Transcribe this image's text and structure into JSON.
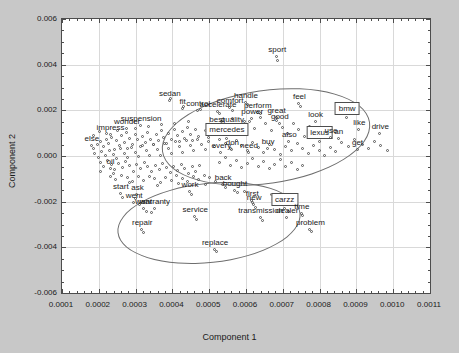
{
  "chart_data": {
    "type": "scatter",
    "title": "",
    "xlabel": "Component 1",
    "ylabel": "Component 2",
    "xlim": [
      0.0001,
      0.0011
    ],
    "ylim": [
      -0.006,
      0.006
    ],
    "xticks": [
      "0.0001",
      "0.0002",
      "0.0003",
      "0.0004",
      "0.0005",
      "0.0006",
      "0.0007",
      "0.0008",
      "0.0009",
      "0.0010",
      "0.0011"
    ],
    "yticks": [
      "0.006",
      "0.004",
      "0.002",
      "0.000",
      "-0.002",
      "-0.004",
      "-0.006"
    ],
    "grid": true,
    "legend": "none",
    "marker": "open-circle",
    "annotations": {
      "ellipses": [
        {
          "name": "upper-right-cluster-ellipse",
          "cx": 0.000655,
          "cy": 0.00085,
          "rx": 0.000285,
          "ry": 0.00205,
          "rotation": -8
        },
        {
          "name": "lower-cluster-ellipse",
          "cx": 0.0005,
          "cy": -0.00295,
          "rx": 0.00025,
          "ry": 0.00175,
          "rotation": -6
        }
      ]
    },
    "labeled_points": [
      {
        "label": "sport",
        "x": 0.000685,
        "y": 0.00435,
        "boxed": false
      },
      {
        "label": "sedan",
        "x": 0.000393,
        "y": 0.00242,
        "boxed": false
      },
      {
        "label": "fit",
        "x": 0.000428,
        "y": 0.00207,
        "boxed": false
      },
      {
        "label": "control",
        "x": 0.00047,
        "y": 0.00196,
        "boxed": false
      },
      {
        "label": "handle",
        "x": 0.0006,
        "y": 0.00232,
        "boxed": false
      },
      {
        "label": "comfort",
        "x": 0.000557,
        "y": 0.00212,
        "boxed": false
      },
      {
        "label": "accelerate",
        "x": 0.000524,
        "y": 0.00194,
        "boxed": false
      },
      {
        "label": "feel",
        "x": 0.000745,
        "y": 0.00228,
        "boxed": false
      },
      {
        "label": "perform",
        "x": 0.000632,
        "y": 0.0019,
        "boxed": false
      },
      {
        "label": "great",
        "x": 0.000683,
        "y": 0.00168,
        "boxed": false
      },
      {
        "label": "power",
        "x": 0.000617,
        "y": 0.00162,
        "boxed": false
      },
      {
        "label": "good",
        "x": 0.000692,
        "y": 0.0014,
        "boxed": false
      },
      {
        "label": "look",
        "x": 0.000789,
        "y": 0.0015,
        "boxed": false
      },
      {
        "label": "bmw",
        "x": 0.000875,
        "y": 0.00168,
        "boxed": true
      },
      {
        "label": "like",
        "x": 0.000908,
        "y": 0.00112,
        "boxed": false
      },
      {
        "label": "drive",
        "x": 0.000965,
        "y": 0.00098,
        "boxed": false
      },
      {
        "label": "best",
        "x": 0.000521,
        "y": 0.00129,
        "boxed": false
      },
      {
        "label": "quality",
        "x": 0.000563,
        "y": 0.00129,
        "boxed": false
      },
      {
        "label": "mercedes",
        "x": 0.000548,
        "y": 0.00075,
        "boxed": true
      },
      {
        "label": "also",
        "x": 0.000718,
        "y": 0.00063,
        "boxed": false
      },
      {
        "label": "lexus",
        "x": 0.0008,
        "y": 0.00062,
        "boxed": true
      },
      {
        "label": "use",
        "x": 0.000831,
        "y": 0.00079,
        "boxed": false
      },
      {
        "label": "an",
        "x": 0.000852,
        "y": 0.00073,
        "boxed": false
      },
      {
        "label": "get",
        "x": 0.000903,
        "y": 0.00028,
        "boxed": false
      },
      {
        "label": "don",
        "x": 0.000563,
        "y": 0.00028,
        "boxed": false
      },
      {
        "label": "every",
        "x": 0.000533,
        "y": 0.00012,
        "boxed": false
      },
      {
        "label": "need",
        "x": 0.000608,
        "y": 0.00014,
        "boxed": false
      },
      {
        "label": "buy",
        "x": 0.00066,
        "y": 0.00032,
        "boxed": false
      },
      {
        "label": "suspension",
        "x": 0.000315,
        "y": 0.00132,
        "boxed": false
      },
      {
        "label": "wonder",
        "x": 0.000277,
        "y": 0.00118,
        "boxed": false
      },
      {
        "label": "impress",
        "x": 0.000232,
        "y": 0.0009,
        "boxed": false
      },
      {
        "label": "else",
        "x": 0.000181,
        "y": 0.00043,
        "boxed": false
      },
      {
        "label": "oil",
        "x": 0.000232,
        "y": -0.00057,
        "boxed": false
      },
      {
        "label": "start",
        "x": 0.00026,
        "y": -0.00165,
        "boxed": false
      },
      {
        "label": "ask",
        "x": 0.000305,
        "y": -0.00172,
        "boxed": false
      },
      {
        "label": "went",
        "x": 0.000296,
        "y": -0.00204,
        "boxed": false
      },
      {
        "label": "want",
        "x": 0.000322,
        "y": -0.00232,
        "boxed": false
      },
      {
        "label": "warranty",
        "x": 0.000352,
        "y": -0.00232,
        "boxed": false
      },
      {
        "label": "repair",
        "x": 0.000318,
        "y": -0.00322,
        "boxed": false
      },
      {
        "label": "work",
        "x": 0.000448,
        "y": -0.00158,
        "boxed": false
      },
      {
        "label": "back",
        "x": 0.000538,
        "y": -0.00128,
        "boxed": false
      },
      {
        "label": "bought",
        "x": 0.00057,
        "y": -0.00152,
        "boxed": false
      },
      {
        "label": "first",
        "x": 0.000617,
        "y": -0.00196,
        "boxed": false
      },
      {
        "label": "new",
        "x": 0.000622,
        "y": -0.00216,
        "boxed": false
      },
      {
        "label": "year",
        "x": 0.00069,
        "y": -0.00204,
        "boxed": false
      },
      {
        "label": "carzz",
        "x": 0.000705,
        "y": -0.00232,
        "boxed": true
      },
      {
        "label": "time",
        "x": 0.000752,
        "y": -0.00252,
        "boxed": false
      },
      {
        "label": "dealer",
        "x": 0.000712,
        "y": -0.00272,
        "boxed": false
      },
      {
        "label": "transmission",
        "x": 0.00064,
        "y": -0.00272,
        "boxed": false
      },
      {
        "label": "service",
        "x": 0.000462,
        "y": -0.00268,
        "boxed": false
      },
      {
        "label": "problem",
        "x": 0.000775,
        "y": -0.00322,
        "boxed": false
      },
      {
        "label": "replace",
        "x": 0.000516,
        "y": -0.0041,
        "boxed": false
      }
    ],
    "cloud_points": [
      [
        0.000186,
        0.0003
      ],
      [
        0.000197,
        0.00048
      ],
      [
        0.000205,
        0.00062
      ],
      [
        0.000213,
        0.00038
      ],
      [
        0.000221,
        0.0007
      ],
      [
        0.000229,
        0.00052
      ],
      [
        0.000236,
        0.00081
      ],
      [
        0.000244,
        0.00025
      ],
      [
        0.00025,
        0.00065
      ],
      [
        0.000257,
        0.00044
      ],
      [
        0.000264,
        0.00088
      ],
      [
        0.000272,
        0.00058
      ],
      [
        0.000279,
        0.00032
      ],
      [
        0.000286,
        0.00075
      ],
      [
        0.000293,
        0.0005
      ],
      [
        0.0003,
        0.00094
      ],
      [
        0.000307,
        0.00068
      ],
      [
        0.000314,
        0.0004
      ],
      [
        0.000321,
        0.00082
      ],
      [
        0.000328,
        0.00056
      ],
      [
        0.000335,
        0.001
      ],
      [
        0.000342,
        0.00072
      ],
      [
        0.00035,
        0.00046
      ],
      [
        0.000357,
        0.0009
      ],
      [
        0.000364,
        0.00064
      ],
      [
        0.000371,
        0.00108
      ],
      [
        0.000378,
        0.00078
      ],
      [
        0.000385,
        0.00052
      ],
      [
        0.000392,
        0.00096
      ],
      [
        0.0004,
        0.0007
      ],
      [
        0.000407,
        0.00116
      ],
      [
        0.000414,
        0.00086
      ],
      [
        0.000421,
        0.0006
      ],
      [
        0.000428,
        0.00104
      ],
      [
        0.000435,
        0.00076
      ],
      [
        0.000443,
        0.00124
      ],
      [
        0.00045,
        0.00094
      ],
      [
        0.000457,
        0.00066
      ],
      [
        0.000464,
        0.00112
      ],
      [
        0.000471,
        0.00084
      ],
      [
        0.00019,
        0.0001
      ],
      [
        0.0002,
        -8e-05
      ],
      [
        0.00021,
        0.00018
      ],
      [
        0.00022,
        -2e-05
      ],
      [
        0.00023,
        0.00024
      ],
      [
        0.00024,
        4e-05
      ],
      [
        0.00025,
        -0.00014
      ],
      [
        0.00026,
        0.0003
      ],
      [
        0.00027,
        8e-05
      ],
      [
        0.00028,
        -0.0001
      ],
      [
        0.00029,
        0.00036
      ],
      [
        0.0003,
        0.00014
      ],
      [
        0.00031,
        -6e-05
      ],
      [
        0.00032,
        0.00042
      ],
      [
        0.00033,
        0.0002
      ],
      [
        0.00034,
        -2e-05
      ],
      [
        0.00035,
        0.00048
      ],
      [
        0.00036,
        0.00026
      ],
      [
        0.00037,
        2e-05
      ],
      [
        0.00038,
        0.00054
      ],
      [
        0.00039,
        0.00032
      ],
      [
        0.0004,
        8e-05
      ],
      [
        0.00041,
        0.0006
      ],
      [
        0.00042,
        0.00038
      ],
      [
        0.00043,
        0.00014
      ],
      [
        0.00044,
        0.00066
      ],
      [
        0.00045,
        0.00044
      ],
      [
        0.00046,
        0.0002
      ],
      [
        0.00047,
        0.00072
      ],
      [
        0.00048,
        0.0005
      ],
      [
        0.00049,
        0.00026
      ],
      [
        0.0005,
        0.00078
      ],
      [
        0.000205,
        -0.0003
      ],
      [
        0.000215,
        -0.00048
      ],
      [
        0.000225,
        -0.00022
      ],
      [
        0.000235,
        -0.0004
      ],
      [
        0.000245,
        -0.00062
      ],
      [
        0.000255,
        -0.00034
      ],
      [
        0.000265,
        -0.00052
      ],
      [
        0.000275,
        -0.00026
      ],
      [
        0.000285,
        -0.00044
      ],
      [
        0.000295,
        -0.00068
      ],
      [
        0.000305,
        -0.00038
      ],
      [
        0.000315,
        -0.00056
      ],
      [
        0.000325,
        -0.0003
      ],
      [
        0.000335,
        -0.00048
      ],
      [
        0.000345,
        -0.00072
      ],
      [
        0.000355,
        -0.00042
      ],
      [
        0.000365,
        -0.0006
      ],
      [
        0.000375,
        -0.00034
      ],
      [
        0.000385,
        -0.00052
      ],
      [
        0.000395,
        -0.00076
      ],
      [
        0.000405,
        -0.00046
      ],
      [
        0.000415,
        -0.00064
      ],
      [
        0.000425,
        -0.00038
      ],
      [
        0.000435,
        -0.00056
      ],
      [
        0.000445,
        -0.0008
      ],
      [
        0.000455,
        -0.0005
      ],
      [
        0.000465,
        -0.00068
      ],
      [
        0.000475,
        -0.00042
      ],
      [
        0.000232,
        -0.0009
      ],
      [
        0.000248,
        -0.00104
      ],
      [
        0.000262,
        -0.00086
      ],
      [
        0.000278,
        -0.00098
      ],
      [
        0.000292,
        -0.00112
      ],
      [
        0.000308,
        -0.00094
      ],
      [
        0.000322,
        -0.00108
      ],
      [
        0.000338,
        -0.0009
      ],
      [
        0.000352,
        -0.00102
      ],
      [
        0.000368,
        -0.00118
      ],
      [
        0.000382,
        -0.00096
      ],
      [
        0.000398,
        -0.0011
      ],
      [
        0.000412,
        -0.00088
      ],
      [
        0.000428,
        -0.001
      ],
      [
        0.000442,
        -0.00116
      ],
      [
        0.000458,
        -0.00094
      ],
      [
        0.000472,
        -0.00106
      ],
      [
        0.000488,
        -0.00086
      ],
      [
        0.000502,
        -0.00098
      ],
      [
        0.000518,
        -0.00114
      ],
      [
        0.00049,
        0.0011
      ],
      [
        0.000505,
        0.00136
      ],
      [
        0.00052,
        0.001
      ],
      [
        0.000535,
        0.0015
      ],
      [
        0.00055,
        0.00118
      ],
      [
        0.000565,
        0.0016
      ],
      [
        0.00058,
        0.00132
      ],
      [
        0.000595,
        0.00104
      ],
      [
        0.00061,
        0.00148
      ],
      [
        0.000625,
        0.0012
      ],
      [
        0.00064,
        0.00166
      ],
      [
        0.000655,
        0.00138
      ],
      [
        0.00067,
        0.00108
      ],
      [
        0.000685,
        0.00152
      ],
      [
        0.0007,
        0.00124
      ],
      [
        0.000715,
        0.00096
      ],
      [
        0.00073,
        0.0014
      ],
      [
        0.000745,
        0.00112
      ],
      [
        0.00076,
        0.00084
      ],
      [
        0.000775,
        0.00128
      ],
      [
        0.0005,
        0.0006
      ],
      [
        0.000515,
        0.0004
      ],
      [
        0.00053,
        0.00072
      ],
      [
        0.000545,
        0.00052
      ],
      [
        0.00056,
        0.0003
      ],
      [
        0.000575,
        0.00064
      ],
      [
        0.00059,
        0.00044
      ],
      [
        0.000605,
        0.00022
      ],
      [
        0.00062,
        0.00056
      ],
      [
        0.000635,
        0.00036
      ],
      [
        0.00065,
        0.00014
      ],
      [
        0.000665,
        0.00048
      ],
      [
        0.00068,
        0.00028
      ],
      [
        0.000695,
        6e-05
      ],
      [
        0.00071,
        0.0004
      ],
      [
        0.000725,
        0.0002
      ],
      [
        0.00074,
        0.00052
      ],
      [
        0.000755,
        0.00032
      ],
      [
        0.00077,
        0.0001
      ],
      [
        0.000785,
        0.00044
      ],
      [
        0.0008,
        0.00024
      ],
      [
        0.000815,
        2e-05
      ],
      [
        0.00083,
        0.00036
      ],
      [
        0.000845,
        0.00016
      ],
      [
        0.00053,
        -0.0003
      ],
      [
        0.000545,
        -0.0001
      ],
      [
        0.00056,
        -0.00042
      ],
      [
        0.000575,
        -0.00022
      ],
      [
        0.00059,
        -0.00054
      ],
      [
        0.000605,
        -0.00034
      ],
      [
        0.00062,
        -0.00014
      ],
      [
        0.000635,
        -0.00046
      ],
      [
        0.00065,
        -0.00026
      ],
      [
        0.000665,
        -0.00058
      ],
      [
        0.00068,
        -0.00038
      ],
      [
        0.000695,
        -0.00018
      ],
      [
        0.00071,
        -0.0005
      ],
      [
        0.000725,
        -0.0003
      ],
      [
        0.00074,
        -0.00062
      ],
      [
        0.000755,
        -0.00042
      ],
      [
        0.000862,
        0.00056
      ],
      [
        0.00088,
        0.0004
      ],
      [
        0.000895,
        0.0007
      ],
      [
        0.000918,
        0.0005
      ],
      [
        0.000935,
        0.00032
      ],
      [
        0.00095,
        0.00062
      ],
      [
        0.000968,
        0.00042
      ],
      [
        0.000985,
        0.00022
      ],
      [
        0.000396,
        0.0025
      ],
      [
        0.000432,
        0.00214
      ],
      [
        0.000478,
        0.002
      ],
      [
        0.00053,
        0.00186
      ],
      [
        0.000566,
        0.00196
      ],
      [
        0.000606,
        0.00222
      ],
      [
        0.00064,
        0.00182
      ],
      [
        0.00075,
        0.00214
      ],
      [
        0.000688,
        0.00416
      ],
      [
        0.00054,
        0.00124
      ],
      [
        0.000572,
        0.00116
      ],
      [
        0.000596,
        0.00148
      ],
      [
        0.000265,
        -0.00182
      ],
      [
        0.0003,
        -0.0019
      ],
      [
        0.000312,
        -0.00214
      ],
      [
        0.00033,
        -0.00244
      ],
      [
        0.000344,
        -0.00248
      ],
      [
        0.000322,
        -0.00338
      ],
      [
        0.000452,
        -0.00172
      ],
      [
        0.000545,
        -0.0014
      ],
      [
        0.000578,
        -0.00164
      ],
      [
        0.00062,
        -0.00208
      ],
      [
        0.000628,
        -0.00228
      ],
      [
        0.000712,
        -0.00216
      ],
      [
        0.000718,
        -0.00244
      ],
      [
        0.000756,
        -0.00264
      ],
      [
        0.000646,
        -0.00284
      ],
      [
        0.000468,
        -0.0028
      ],
      [
        0.00078,
        -0.00334
      ],
      [
        0.00052,
        -0.00422
      ],
      [
        0.000596,
        -0.00158
      ],
      [
        0.000672,
        -0.0017
      ],
      [
        0.000242,
        -0.00078
      ],
      [
        0.000206,
        -0.00072
      ],
      [
        0.000284,
        -0.0012
      ],
      [
        0.00036,
        -0.0013
      ],
      [
        0.000418,
        -0.00124
      ],
      [
        0.000492,
        -0.00126
      ],
      [
        0.000188,
        0.00086
      ],
      [
        0.000204,
        0.00104
      ],
      [
        0.000222,
        0.00096
      ],
      [
        0.000252,
        0.0011
      ],
      [
        0.000276,
        0.00102
      ],
      [
        0.0003,
        0.0012
      ],
      [
        0.000336,
        0.00126
      ],
      [
        0.000372,
        0.00134
      ],
      [
        0.000408,
        0.00142
      ],
      [
        0.000444,
        0.0015
      ]
    ]
  }
}
